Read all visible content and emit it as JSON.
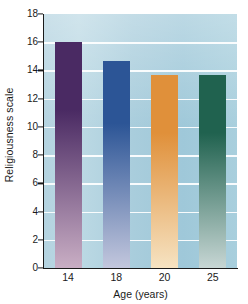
{
  "chart_data": {
    "type": "bar",
    "title": "",
    "xlabel": "Age (years)",
    "ylabel": "Religiousness scale",
    "categories": [
      "14",
      "18",
      "20",
      "25"
    ],
    "values": [
      16.0,
      14.7,
      13.7,
      13.7
    ],
    "ylim": [
      0,
      18
    ],
    "ytick_values": [
      0,
      2,
      4,
      6,
      8,
      10,
      12,
      14,
      16,
      18
    ],
    "ytick_labels": [
      "0",
      "2",
      "4",
      "6",
      "8",
      "10",
      "12",
      "14",
      "16",
      "18"
    ],
    "grid": "horizontal-white-at-even-values",
    "legend": "none",
    "bars": [
      {
        "category": "14",
        "value": 16.0,
        "color_top": "#4a2a63",
        "color_bottom": "#c9aec4"
      },
      {
        "category": "18",
        "value": 14.7,
        "color_top": "#2c5596",
        "color_bottom": "#c3c7dd"
      },
      {
        "category": "20",
        "value": 13.7,
        "color_top": "#e0903a",
        "color_bottom": "#f6e3c2"
      },
      {
        "category": "25",
        "value": 13.7,
        "color_top": "#20624f",
        "color_bottom": "#c7d6d4"
      }
    ],
    "plot_background_color": "#aed0dd",
    "gridline_color": "#ffffff",
    "axis_color": "#1a1a1a"
  }
}
